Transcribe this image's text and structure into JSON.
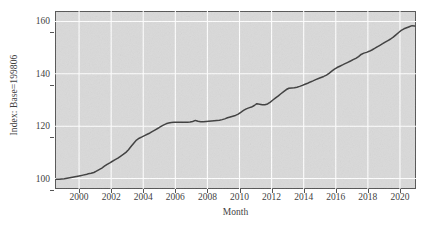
{
  "chart_data": {
    "type": "line",
    "title": "",
    "xlabel": "Month",
    "ylabel": "Index: Base=199806",
    "xlim": [
      1998.5,
      2021.0
    ],
    "ylim": [
      96.0,
      164.0
    ],
    "grid": true,
    "legend": null,
    "x_ticks": [
      "2000",
      "2002",
      "2004",
      "2006",
      "2008",
      "2010",
      "2012",
      "2014",
      "2016",
      "2018",
      "2020"
    ],
    "x_tick_values": [
      2000,
      2002,
      2004,
      2006,
      2008,
      2010,
      2012,
      2014,
      2016,
      2018,
      2020
    ],
    "y_ticks": [
      "100",
      "120",
      "140",
      "160"
    ],
    "y_tick_values": [
      100,
      120,
      140,
      160
    ],
    "series": [
      {
        "name": "Index",
        "color": "#3d3d3d",
        "x": [
          1998.58,
          1998.75,
          1998.92,
          1999.08,
          1999.25,
          1999.42,
          1999.58,
          1999.75,
          1999.92,
          2000.08,
          2000.25,
          2000.42,
          2000.58,
          2000.75,
          2000.92,
          2001.08,
          2001.25,
          2001.42,
          2001.58,
          2001.75,
          2001.92,
          2002.08,
          2002.25,
          2002.42,
          2002.58,
          2002.75,
          2002.92,
          2003.08,
          2003.25,
          2003.42,
          2003.58,
          2003.75,
          2003.92,
          2004.08,
          2004.25,
          2004.42,
          2004.58,
          2004.75,
          2004.92,
          2005.08,
          2005.25,
          2005.42,
          2005.58,
          2005.75,
          2005.92,
          2006.08,
          2006.25,
          2006.42,
          2006.58,
          2006.75,
          2006.92,
          2007.08,
          2007.25,
          2007.42,
          2007.58,
          2007.75,
          2007.92,
          2008.08,
          2008.25,
          2008.42,
          2008.58,
          2008.75,
          2008.92,
          2009.08,
          2009.25,
          2009.42,
          2009.58,
          2009.75,
          2009.92,
          2010.08,
          2010.25,
          2010.42,
          2010.58,
          2010.75,
          2010.92,
          2011.08,
          2011.25,
          2011.42,
          2011.58,
          2011.75,
          2011.92,
          2012.08,
          2012.25,
          2012.42,
          2012.58,
          2012.75,
          2012.92,
          2013.08,
          2013.25,
          2013.42,
          2013.58,
          2013.75,
          2013.92,
          2014.08,
          2014.25,
          2014.42,
          2014.58,
          2014.75,
          2014.92,
          2015.08,
          2015.25,
          2015.42,
          2015.58,
          2015.75,
          2015.92,
          2016.08,
          2016.25,
          2016.42,
          2016.58,
          2016.75,
          2016.92,
          2017.08,
          2017.25,
          2017.42,
          2017.58,
          2017.75,
          2017.92,
          2018.08,
          2018.25,
          2018.42,
          2018.58,
          2018.75,
          2018.92,
          2019.08,
          2019.25,
          2019.42,
          2019.58,
          2019.75,
          2019.92,
          2020.08,
          2020.25,
          2020.42,
          2020.58,
          2020.75,
          2020.92
        ],
        "y": [
          99.7,
          99.7,
          99.8,
          99.9,
          100.1,
          100.3,
          100.5,
          100.7,
          100.9,
          101.1,
          101.3,
          101.5,
          101.8,
          102.0,
          102.3,
          102.8,
          103.4,
          104.0,
          104.7,
          105.4,
          106.0,
          106.6,
          107.2,
          107.8,
          108.5,
          109.2,
          110.0,
          111.0,
          112.3,
          113.6,
          114.7,
          115.4,
          115.9,
          116.4,
          116.9,
          117.4,
          118.0,
          118.6,
          119.2,
          119.8,
          120.4,
          120.9,
          121.2,
          121.4,
          121.5,
          121.5,
          121.5,
          121.5,
          121.5,
          121.5,
          121.6,
          121.8,
          122.2,
          121.9,
          121.7,
          121.7,
          121.8,
          121.9,
          122.0,
          122.1,
          122.2,
          122.3,
          122.5,
          122.8,
          123.2,
          123.5,
          123.8,
          124.1,
          124.6,
          125.3,
          126.0,
          126.6,
          127.0,
          127.3,
          127.9,
          128.6,
          128.4,
          128.2,
          128.2,
          128.5,
          129.2,
          130.0,
          130.8,
          131.6,
          132.4,
          133.2,
          134.0,
          134.5,
          134.6,
          134.7,
          134.9,
          135.2,
          135.6,
          136.0,
          136.4,
          136.9,
          137.3,
          137.8,
          138.2,
          138.6,
          139.0,
          139.5,
          140.2,
          141.0,
          141.8,
          142.4,
          142.9,
          143.4,
          143.9,
          144.4,
          144.9,
          145.4,
          145.9,
          146.6,
          147.4,
          147.9,
          148.2,
          148.6,
          149.1,
          149.7,
          150.3,
          150.9,
          151.5,
          152.1,
          152.7,
          153.3,
          154.0,
          154.9,
          155.8,
          156.6,
          157.2,
          157.6,
          158.0,
          158.4,
          158.3
        ]
      }
    ]
  }
}
